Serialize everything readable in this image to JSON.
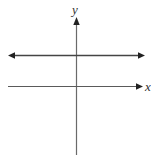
{
  "diagram": {
    "type": "coordinate-plane",
    "axes": {
      "x_label": "x",
      "y_label": "y"
    },
    "lines": [
      {
        "name": "horizontal-line",
        "description": "horizontal line above x-axis with arrows on both ends"
      }
    ],
    "colors": {
      "axis": "#555555",
      "line": "#444444",
      "background": "#ffffff"
    }
  }
}
